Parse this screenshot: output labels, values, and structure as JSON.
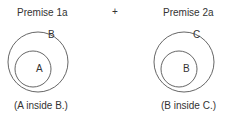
{
  "panels": [
    {
      "title": "Premise 1a",
      "outer_label": "B",
      "inner_label": "A",
      "caption": "(A inside B.)"
    },
    {
      "title": "Premise 2a",
      "outer_label": "C",
      "inner_label": "B",
      "caption": "(B inside C.)"
    }
  ],
  "operator": "+",
  "colors": {
    "stroke": "#555555",
    "text": "#333333"
  }
}
